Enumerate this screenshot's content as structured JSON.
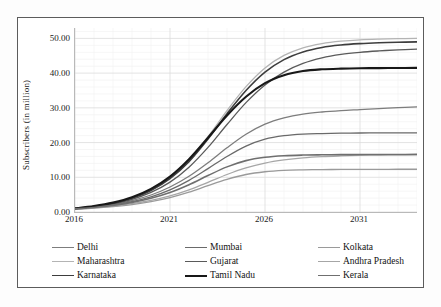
{
  "axis": {
    "ylabel": "Subscribers (in million)",
    "yticks": [
      "0.00",
      "10.00",
      "20.00",
      "30.00",
      "40.00",
      "50.00"
    ],
    "ytick_values": [
      0,
      10,
      20,
      30,
      40,
      50
    ],
    "xticks": [
      "2016",
      "2021",
      "2026",
      "2031"
    ],
    "xtick_values": [
      2016,
      2021,
      2026,
      2031
    ]
  },
  "legend": {
    "rows": [
      [
        {
          "label": "Delhi",
          "color": "#7d7d7d",
          "width": 1.3
        },
        {
          "label": "Mumbai",
          "color": "#6a6a6a",
          "width": 1.3
        },
        {
          "label": "Kolkata",
          "color": "#9a9a9a",
          "width": 1.3
        }
      ],
      [
        {
          "label": "Maharashtra",
          "color": "#b4b4b4",
          "width": 1.3
        },
        {
          "label": "Gujarat",
          "color": "#5a5a5a",
          "width": 1.3
        },
        {
          "label": "Andhra Pradesh",
          "color": "#a6a6a6",
          "width": 1.3
        }
      ],
      [
        {
          "label": "Karnataka",
          "color": "#3d3d3d",
          "width": 1.6
        },
        {
          "label": "Tamil Nadu",
          "color": "#181818",
          "width": 2.1
        },
        {
          "label": "Kerala",
          "color": "#6f6f6f",
          "width": 1.6
        }
      ]
    ]
  },
  "chart_data": {
    "type": "line",
    "title": "",
    "xlabel": "",
    "ylabel": "Subscribers (in million)",
    "xlim": [
      2016,
      2034
    ],
    "ylim": [
      0,
      53
    ],
    "grid": true,
    "legend_position": "bottom",
    "x": [
      2016,
      2017,
      2018,
      2019,
      2020,
      2021,
      2022,
      2023,
      2024,
      2025,
      2026,
      2027,
      2028,
      2029,
      2030,
      2031,
      2032,
      2033,
      2034
    ],
    "series": [
      {
        "name": "Delhi",
        "color": "#7d7d7d",
        "width": 1.3,
        "values": [
          0.95,
          1.45,
          2.2,
          3.3,
          4.9,
          7.2,
          10.3,
          14.2,
          18.5,
          22.4,
          25.3,
          27.1,
          28.2,
          28.8,
          29.2,
          29.5,
          29.8,
          30.05,
          30.3
        ]
      },
      {
        "name": "Mumbai",
        "color": "#6a6a6a",
        "width": 1.3,
        "values": [
          0.9,
          1.35,
          2.0,
          2.95,
          4.35,
          6.35,
          9.1,
          12.5,
          16.0,
          19.0,
          21.0,
          22.0,
          22.45,
          22.6,
          22.7,
          22.75,
          22.78,
          22.8,
          22.82
        ]
      },
      {
        "name": "Kolkata",
        "color": "#9a9a9a",
        "width": 1.3,
        "values": [
          0.8,
          1.1,
          1.55,
          2.15,
          3.0,
          4.15,
          5.7,
          7.6,
          9.4,
          10.8,
          11.6,
          12.0,
          12.15,
          12.22,
          12.26,
          12.28,
          12.3,
          12.31,
          12.32
        ]
      },
      {
        "name": "Maharashtra",
        "color": "#b4b4b4",
        "width": 1.3,
        "values": [
          1.0,
          1.6,
          2.55,
          4.05,
          6.4,
          9.9,
          15.0,
          21.7,
          29.2,
          36.1,
          41.5,
          45.1,
          47.3,
          48.5,
          49.2,
          49.6,
          49.8,
          49.92,
          50.0
        ]
      },
      {
        "name": "Gujarat",
        "color": "#5a5a5a",
        "width": 1.3,
        "values": [
          0.95,
          1.5,
          2.35,
          3.65,
          5.65,
          8.6,
          12.9,
          18.6,
          25.2,
          31.5,
          36.6,
          40.3,
          42.8,
          44.4,
          45.4,
          46.0,
          46.4,
          46.7,
          46.9
        ]
      },
      {
        "name": "Andhra Pradesh",
        "color": "#a6a6a6",
        "width": 1.3,
        "values": [
          0.85,
          1.2,
          1.7,
          2.4,
          3.35,
          4.65,
          6.4,
          8.55,
          10.8,
          12.7,
          14.1,
          15.0,
          15.6,
          15.95,
          16.15,
          16.3,
          16.4,
          16.45,
          16.5
        ]
      },
      {
        "name": "Karnataka",
        "color": "#3d3d3d",
        "width": 1.6,
        "values": [
          1.0,
          1.6,
          2.5,
          3.95,
          6.2,
          9.6,
          14.5,
          21.0,
          28.3,
          35.0,
          40.3,
          43.9,
          46.1,
          47.4,
          48.1,
          48.5,
          48.75,
          48.9,
          49.0
        ]
      },
      {
        "name": "Tamil Nadu",
        "color": "#181818",
        "width": 2.1,
        "values": [
          1.05,
          1.7,
          2.7,
          4.25,
          6.65,
          10.2,
          15.2,
          21.4,
          27.8,
          33.2,
          37.1,
          39.4,
          40.6,
          41.1,
          41.3,
          41.4,
          41.45,
          41.48,
          41.5
        ]
      },
      {
        "name": "Kerala",
        "color": "#6f6f6f",
        "width": 1.6,
        "values": [
          0.9,
          1.3,
          1.9,
          2.75,
          3.95,
          5.6,
          7.85,
          10.5,
          13.0,
          14.8,
          15.75,
          16.2,
          16.4,
          16.48,
          16.52,
          16.55,
          16.57,
          16.58,
          16.59
        ]
      }
    ]
  }
}
